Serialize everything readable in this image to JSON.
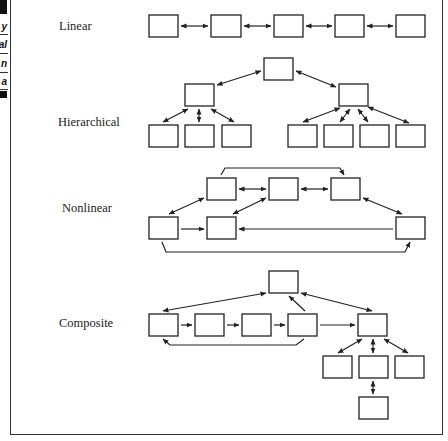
{
  "left_strip": {
    "fragments": [
      "y",
      "al",
      "n",
      "a"
    ]
  },
  "diagram": {
    "sections": [
      {
        "id": "linear",
        "label": "Linear"
      },
      {
        "id": "hierarchical",
        "label": "Hierarchical"
      },
      {
        "id": "nonlinear",
        "label": "Nonlinear"
      },
      {
        "id": "composite",
        "label": "Composite"
      }
    ],
    "colors": {
      "stroke": "#222222",
      "background": "#ffffff"
    }
  }
}
